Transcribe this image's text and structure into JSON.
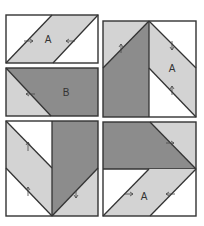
{
  "diagram": {
    "type": "quilt-block-assembly",
    "colors": {
      "light": "#d3d3d3",
      "dark": "#8c8c8c",
      "background": "#ffffff",
      "line": "#333333"
    },
    "blocks": [
      {
        "id": "top-left",
        "label": "A",
        "shape": "parallelogram-unit"
      },
      {
        "id": "middle-left",
        "label": "B",
        "shape": "half-triangle-unit"
      },
      {
        "id": "top-right",
        "label": "A",
        "shape": "chevron-half-block"
      },
      {
        "id": "bottom-left",
        "label": "",
        "shape": "chevron-half-block"
      },
      {
        "id": "bottom-right",
        "label": "A",
        "shape": "chevron-half-block"
      }
    ]
  }
}
